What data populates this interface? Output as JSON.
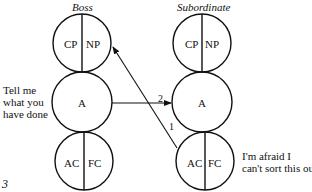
{
  "figure_number": "3",
  "boss": {
    "title": "Boss",
    "parent": {
      "left": "CP",
      "right": "NP"
    },
    "adult": "A",
    "child": {
      "left": "AC",
      "right": "FC"
    },
    "speech": [
      "Tell me",
      "what you",
      "have done"
    ]
  },
  "subordinate": {
    "title": "Subordinate",
    "parent": {
      "left": "CP",
      "right": "NP"
    },
    "adult": "A",
    "child": {
      "left": "AC",
      "right": "FC"
    },
    "speech": [
      "I'm afraid I",
      "can't sort this out"
    ]
  },
  "transactions": [
    {
      "label": "1",
      "from": "subordinate.child",
      "to": "boss.parent"
    },
    {
      "label": "2",
      "from": "boss.adult",
      "to": "subordinate.adult"
    }
  ]
}
